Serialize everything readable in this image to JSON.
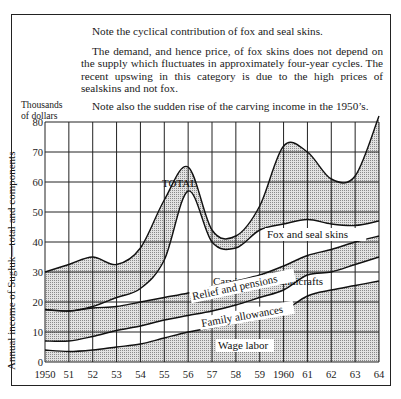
{
  "notes": {
    "line1": "Note the cyclical contribution of fox and seal skins.",
    "line2": "The demand, and hence price, of fox skins does not depend on the supply which fluctuates in approximately four-year cycles. The recent upswing in this category is due to the high prices of sealskins and not fox.",
    "line3": "Note also the sudden rise of the carving income in the 1950’s."
  },
  "axis": {
    "y_unit": "Thousands of dollars",
    "y_unit_line1": "Thousands",
    "y_unit_line2": "of dollars",
    "y_title": "Annual income of Sugluķ—total and components"
  },
  "chart_data": {
    "type": "area",
    "title": "Annual income of Sugluk—total and components",
    "xlabel": "",
    "ylabel": "Annual income of Sugluk—total and components (Thousands of dollars)",
    "xlim": [
      1950,
      1964
    ],
    "ylim": [
      0,
      80
    ],
    "grid": true,
    "stacked": true,
    "x": [
      1950,
      1951,
      1952,
      1953,
      1954,
      1955,
      1956,
      1957,
      1958,
      1959,
      1960,
      1961,
      1962,
      1963,
      1964
    ],
    "x_tick_labels": [
      "1950",
      "51",
      "52",
      "53",
      "54",
      "55",
      "56",
      "57",
      "58",
      "59",
      "1960",
      "61",
      "62",
      "63",
      "64"
    ],
    "y_ticks": [
      0,
      10,
      20,
      30,
      40,
      50,
      60,
      70,
      80
    ],
    "cumulative_series": [
      {
        "name": "Wage labor",
        "shaded": true,
        "values": [
          4,
          3.5,
          4,
          5,
          6,
          8,
          10,
          11.5,
          13,
          14.5,
          17,
          22,
          24,
          25.5,
          27
        ]
      },
      {
        "name": "Family allowances",
        "shaded": false,
        "values": [
          7,
          7,
          8.5,
          10.5,
          12,
          14,
          15.5,
          17,
          19,
          21.5,
          24,
          29,
          30,
          32.5,
          35
        ]
      },
      {
        "name": "Relief and pensions",
        "shaded": true,
        "values": [
          17.5,
          17,
          18,
          18.5,
          20,
          21.5,
          23,
          25,
          27,
          29,
          32,
          35.5,
          37.5,
          40,
          42
        ]
      },
      {
        "name": "Carvings and handicrafts",
        "shaded": false,
        "values": [
          17.5,
          17,
          18.5,
          21.5,
          24.5,
          34,
          57,
          40,
          38,
          44,
          46,
          47.5,
          46,
          45.5,
          47
        ]
      },
      {
        "name": "Fox and seal skins",
        "shaded": true,
        "values": [
          30,
          32.5,
          35,
          32.5,
          38,
          54,
          65,
          44,
          42,
          52,
          72,
          70,
          61,
          62,
          82
        ]
      }
    ],
    "series_labels": {
      "total": "TOTAL",
      "fox": "Fox and seal skins",
      "carvings": "Carvings and handicrafts",
      "relief": "Relief and pensions",
      "family": "Family allowances",
      "wage": "Wage labor"
    },
    "annotations": [
      "TOTAL"
    ]
  }
}
